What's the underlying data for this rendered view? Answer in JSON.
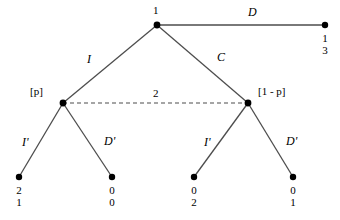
{
  "figure": {
    "type": "extensive-form-game-tree",
    "background_color": "#ffffff",
    "line_color": "#4d4d4d",
    "node_color": "#000000"
  },
  "nodes": {
    "root": {
      "label": "1",
      "x": 157,
      "y": 25
    },
    "left_info": {
      "label": "[p]",
      "x": 63,
      "y": 103
    },
    "right_info": {
      "label": "[1 - p]",
      "x": 248,
      "y": 103
    }
  },
  "information_set": {
    "label": "2",
    "style": "dashed",
    "from_x": 63,
    "to_x": 248,
    "y": 103
  },
  "actions": {
    "root_d": "D",
    "root_i": "I",
    "root_c": "C",
    "left_i_prime": "I'",
    "left_d_prime": "D'",
    "right_i_prime": "I'",
    "right_d_prime": "D'"
  },
  "terminals": [
    {
      "id": "t_d",
      "x": 325,
      "y": 25,
      "payoff_top": "1",
      "payoff_bottom": "3"
    },
    {
      "id": "t_ii",
      "x": 19,
      "y": 177,
      "payoff_top": "2",
      "payoff_bottom": "1"
    },
    {
      "id": "t_id",
      "x": 112,
      "y": 177,
      "payoff_top": "0",
      "payoff_bottom": "0"
    },
    {
      "id": "t_ci",
      "x": 194,
      "y": 177,
      "payoff_top": "0",
      "payoff_bottom": "2"
    },
    {
      "id": "t_cd",
      "x": 293,
      "y": 177,
      "payoff_top": "0",
      "payoff_bottom": "1"
    }
  ]
}
